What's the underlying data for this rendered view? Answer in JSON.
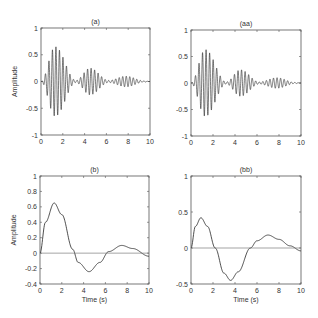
{
  "figure": {
    "panels": [
      {
        "id": "a",
        "title": "(a)",
        "ylabel": "Amplitude",
        "xlabel": "",
        "yticks": [
          "1",
          "0.5",
          "0",
          "-0.5",
          "-1"
        ],
        "xticks": [
          "0",
          "2",
          "4",
          "6",
          "8",
          "10"
        ]
      },
      {
        "id": "aa",
        "title": "(aa)",
        "ylabel": "",
        "xlabel": "",
        "yticks": [
          "1",
          "0.5",
          "0",
          "-0.5",
          "-1"
        ],
        "xticks": [
          "0",
          "2",
          "4",
          "6",
          "8",
          "10"
        ]
      },
      {
        "id": "b",
        "title": "(b)",
        "ylabel": "Amplitude",
        "xlabel": "Time (s)",
        "yticks": [
          "1",
          "0.8",
          "0.6",
          "0.4",
          "0.2",
          "0",
          "-0.2",
          "-0.4"
        ],
        "xticks": [
          "0",
          "2",
          "4",
          "6",
          "8",
          "10"
        ]
      },
      {
        "id": "bb",
        "title": "(bb)",
        "ylabel": "",
        "xlabel": "Time (s)",
        "yticks": [
          "1",
          "0.5",
          "0",
          "-0.5"
        ],
        "xticks": [
          "0",
          "2",
          "4",
          "6",
          "8",
          "10"
        ]
      }
    ]
  },
  "chart_data": [
    {
      "type": "line",
      "title": "(a)",
      "xlabel": "",
      "ylabel": "Amplitude",
      "xlim": [
        0,
        10
      ],
      "ylim": [
        -1,
        1
      ],
      "description": "Amplitude-modulated oscillation; envelope peaks ~0.65 at t~1.3, ~0.25 at t~4.5, ~0.1 at t~7.8, decays to 0 at t=10",
      "envelope": {
        "x": [
          0,
          1.3,
          3.2,
          4.5,
          6.2,
          7.8,
          9.5,
          10
        ],
        "y": [
          0,
          0.65,
          0.02,
          0.25,
          0.02,
          0.1,
          0.01,
          0
        ]
      }
    },
    {
      "type": "line",
      "title": "(aa)",
      "xlabel": "",
      "ylabel": "",
      "xlim": [
        0,
        10
      ],
      "ylim": [
        -1,
        1
      ],
      "description": "Amplitude-modulated oscillation nearly identical to (a)",
      "envelope": {
        "x": [
          0,
          1.3,
          3.2,
          4.5,
          6.2,
          7.8,
          9.5,
          10
        ],
        "y": [
          0,
          0.63,
          0.02,
          0.25,
          0.02,
          0.1,
          0.01,
          0
        ]
      }
    },
    {
      "type": "line",
      "title": "(b)",
      "xlabel": "Time (s)",
      "ylabel": "Amplitude",
      "xlim": [
        0,
        10
      ],
      "ylim": [
        -0.4,
        1
      ],
      "series": [
        {
          "name": "response",
          "x": [
            0,
            0.5,
            1.3,
            2,
            3,
            3.5,
            4.5,
            5.5,
            6.3,
            7.5,
            8.5,
            10
          ],
          "y": [
            0,
            0.4,
            0.65,
            0.5,
            0.05,
            -0.12,
            -0.24,
            -0.12,
            0.02,
            0.1,
            0.06,
            -0.04
          ]
        },
        {
          "name": "zero-line",
          "x": [
            0,
            10
          ],
          "y": [
            0,
            0
          ]
        }
      ]
    },
    {
      "type": "line",
      "title": "(bb)",
      "xlabel": "Time (s)",
      "ylabel": "",
      "xlim": [
        0,
        10
      ],
      "ylim": [
        -0.5,
        1
      ],
      "series": [
        {
          "name": "response",
          "x": [
            0,
            0.4,
            0.9,
            1.5,
            2.2,
            3,
            3.6,
            4.3,
            5.4,
            6,
            7,
            8,
            9,
            10
          ],
          "y": [
            0,
            0.3,
            0.42,
            0.3,
            0,
            -0.35,
            -0.45,
            -0.33,
            0,
            0.1,
            0.18,
            0.12,
            0.03,
            -0.04
          ]
        },
        {
          "name": "zero-line",
          "x": [
            0,
            10
          ],
          "y": [
            0,
            0
          ]
        }
      ]
    }
  ]
}
